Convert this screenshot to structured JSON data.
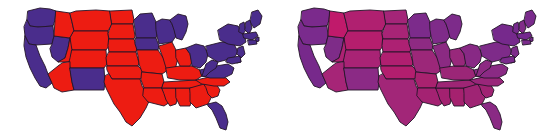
{
  "figure": {
    "background_color": "#ffffff",
    "width": 548,
    "height": 139,
    "panel_count": 2
  },
  "palette": {
    "republican_red": "#ED1C12",
    "democrat_blue": "#4A2D8C",
    "border_stroke": "#241528",
    "background": "#ffffff",
    "purple_mid": "#7B2A8C",
    "purple_red_lean": "#C01A6B",
    "purple_blue_lean": "#5E2B8E"
  },
  "panels": [
    {
      "id": "binary-map",
      "name": "winner-take-all-map",
      "title": "",
      "color_mode": "binary",
      "description": "United States map with each state filled solid red or solid blue by statewide winner"
    },
    {
      "id": "purple-map",
      "name": "purple-america-map",
      "title": "",
      "color_mode": "blended",
      "description": "United States map with each state filled a red-blue blend proportional to the vote share"
    }
  ],
  "chart_data": {
    "type": "map",
    "title": "",
    "subtitle": "",
    "xlabel": "",
    "ylabel": "",
    "grid": false,
    "legend_position": "none",
    "projection": "albers-usa-simplified",
    "panels": [
      "winner-take-all",
      "purple-america"
    ],
    "categories": [
      "WA",
      "OR",
      "CA",
      "NV",
      "ID",
      "MT",
      "WY",
      "UT",
      "AZ",
      "NM",
      "CO",
      "ND",
      "SD",
      "NE",
      "KS",
      "OK",
      "TX",
      "MN",
      "IA",
      "MO",
      "AR",
      "LA",
      "WI",
      "IL",
      "MS",
      "AL",
      "TN",
      "KY",
      "MI",
      "IN",
      "OH",
      "GA",
      "FL",
      "SC",
      "NC",
      "VA",
      "WV",
      "PA",
      "NY",
      "ME",
      "VT",
      "NH",
      "MA",
      "RI",
      "CT",
      "NJ",
      "DE",
      "MD"
    ],
    "series": [
      {
        "name": "binary_winner",
        "note": "blue = democrat win, red = republican win",
        "values": {
          "WA": "blue",
          "OR": "blue",
          "CA": "blue",
          "NV": "blue",
          "ID": "red",
          "MT": "red",
          "WY": "red",
          "UT": "red",
          "AZ": "red",
          "NM": "blue",
          "CO": "red",
          "ND": "red",
          "SD": "red",
          "NE": "red",
          "KS": "red",
          "OK": "red",
          "TX": "red",
          "MN": "blue",
          "IA": "blue",
          "MO": "red",
          "AR": "red",
          "LA": "red",
          "WI": "blue",
          "IL": "red",
          "MS": "red",
          "AL": "red",
          "TN": "red",
          "KY": "red",
          "MI": "blue",
          "IN": "red",
          "OH": "blue",
          "GA": "red",
          "FL": "blue",
          "SC": "red",
          "NC": "red",
          "VA": "blue",
          "WV": "blue",
          "PA": "blue",
          "NY": "blue",
          "ME": "blue",
          "VT": "blue",
          "NH": "blue",
          "MA": "blue",
          "RI": "blue",
          "CT": "blue",
          "NJ": "blue",
          "DE": "blue",
          "MD": "blue"
        }
      },
      {
        "name": "blended_fill",
        "note": "hex blend of red and blue weighted by vote share",
        "values": {
          "WA": "#7B2A8C",
          "OR": "#7A2B8D",
          "CA": "#77298B",
          "NV": "#7E2C88",
          "ID": "#C01A6B",
          "MT": "#B02070",
          "WY": "#B51E6D",
          "UT": "#AE2173",
          "AZ": "#A62577",
          "NM": "#8B2A85",
          "CO": "#A92375",
          "ND": "#A42578",
          "SD": "#A82476",
          "NE": "#AD2173",
          "KS": "#B01F70",
          "OK": "#B31E6E",
          "TX": "#A22678",
          "MN": "#7C2B8B",
          "IA": "#8E2A83",
          "MO": "#9C2779",
          "AR": "#A9226F",
          "LA": "#A42272",
          "WI": "#7F2B89",
          "IL": "#8B2A82",
          "MS": "#A32170",
          "AL": "#A5216F",
          "TN": "#9E2575",
          "KY": "#9B2677",
          "MI": "#7D2B8A",
          "IN": "#98287B",
          "OH": "#882985",
          "GA": "#9F2474",
          "FL": "#8A2A84",
          "SC": "#A02373",
          "NC": "#99267A",
          "VA": "#8A2A84",
          "WV": "#8D2A82",
          "PA": "#7E2B89",
          "NY": "#76298C",
          "ME": "#7A2B8C",
          "VT": "#762A8D",
          "NH": "#812C88",
          "MA": "#73288E",
          "RI": "#76298C",
          "CT": "#7A2B8B",
          "NJ": "#7D2B8A",
          "DE": "#7C2B8B",
          "MD": "#7B2A8C"
        }
      }
    ]
  },
  "accessibility": {
    "alt_left": "Map of the contiguous United States where each state is colored entirely red or entirely blue",
    "alt_right": "The same map of the contiguous United States where each state is colored a shade of purple between red and blue"
  }
}
